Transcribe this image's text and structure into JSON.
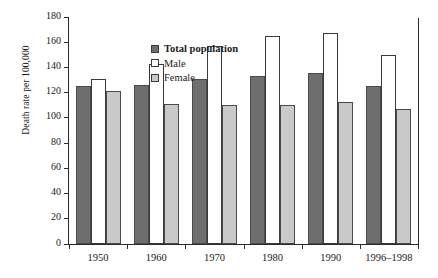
{
  "chart_data": {
    "type": "bar",
    "title": "",
    "xlabel": "",
    "ylabel": "Death rate per 100,000",
    "ylim": [
      0,
      180
    ],
    "ytick_step": 20,
    "yticks": [
      0,
      20,
      40,
      60,
      80,
      100,
      120,
      140,
      160,
      180
    ],
    "grid": false,
    "legend_position": "top-left",
    "categories": [
      "1950",
      "1960",
      "1970",
      "1980",
      "1990",
      "1996–1998"
    ],
    "series": [
      {
        "name": "Total population",
        "color": "#6e6e6e",
        "values": [
          125,
          126,
          131,
          133,
          136,
          125
        ]
      },
      {
        "name": "Male",
        "color": "#ffffff",
        "values": [
          131,
          143,
          157,
          165,
          167,
          150
        ]
      },
      {
        "name": "Female",
        "color": "#c9c9c9",
        "values": [
          121,
          111,
          110,
          110,
          113,
          107
        ]
      }
    ]
  }
}
